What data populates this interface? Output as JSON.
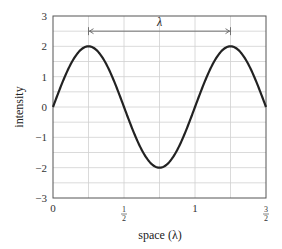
{
  "chart_data": {
    "type": "line",
    "title": "",
    "xlabel": "space (λ)",
    "ylabel": "intensity",
    "xlim": [
      0,
      1.5
    ],
    "ylim": [
      -3,
      3
    ],
    "grid": true,
    "x_ticks": [
      {
        "value": 0,
        "label": "0"
      },
      {
        "value": 0.5,
        "label": "1/2"
      },
      {
        "value": 1,
        "label": "1"
      },
      {
        "value": 1.5,
        "label": "3/2"
      }
    ],
    "y_ticks": [
      {
        "value": 3,
        "label": "3"
      },
      {
        "value": 2,
        "label": "2"
      },
      {
        "value": 1,
        "label": "1"
      },
      {
        "value": 0,
        "label": "0"
      },
      {
        "value": -1,
        "label": "−1"
      },
      {
        "value": -2,
        "label": "−2"
      },
      {
        "value": -3,
        "label": "−3"
      }
    ],
    "x_grid": [
      0.25,
      0.5,
      0.75,
      1,
      1.25
    ],
    "y_grid": [
      -2.5,
      -2,
      -1.5,
      -1,
      -0.5,
      0,
      0.5,
      1,
      1.5,
      2,
      2.5
    ],
    "series": [
      {
        "name": "2 sin(2πx)",
        "amplitude": 2,
        "wavelength": 1,
        "x": [
          0,
          0.125,
          0.25,
          0.375,
          0.5,
          0.625,
          0.75,
          0.875,
          1,
          1.125,
          1.25,
          1.375,
          1.5
        ],
        "values": [
          0,
          1.41,
          2,
          1.41,
          0,
          -1.41,
          -2,
          -1.41,
          0,
          1.41,
          2,
          1.41,
          0
        ],
        "color": "#222222"
      }
    ],
    "annotations": [
      {
        "type": "dimension-arrow",
        "x_start": 0.25,
        "x_end": 1.25,
        "y": 2.5,
        "label": "λ"
      }
    ],
    "legend": null
  }
}
